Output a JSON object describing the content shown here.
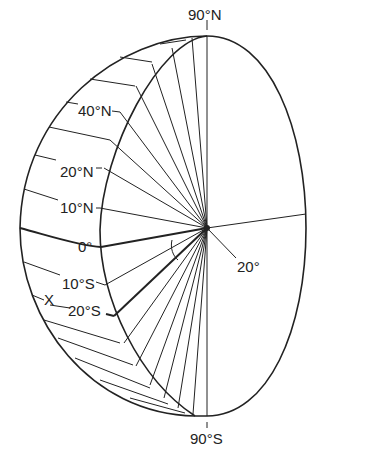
{
  "diagram": {
    "labels": {
      "north_pole": "90°N",
      "south_pole": "90°S",
      "lat_40n": "40°N",
      "lat_20n": "20°N",
      "lat_10n": "10°N",
      "equator": "0°",
      "lat_10s": "10°S",
      "lat_20s": "20°S",
      "point_x": "X",
      "angle": "20°"
    },
    "colors": {
      "line": "#222222",
      "background": "#ffffff"
    }
  }
}
